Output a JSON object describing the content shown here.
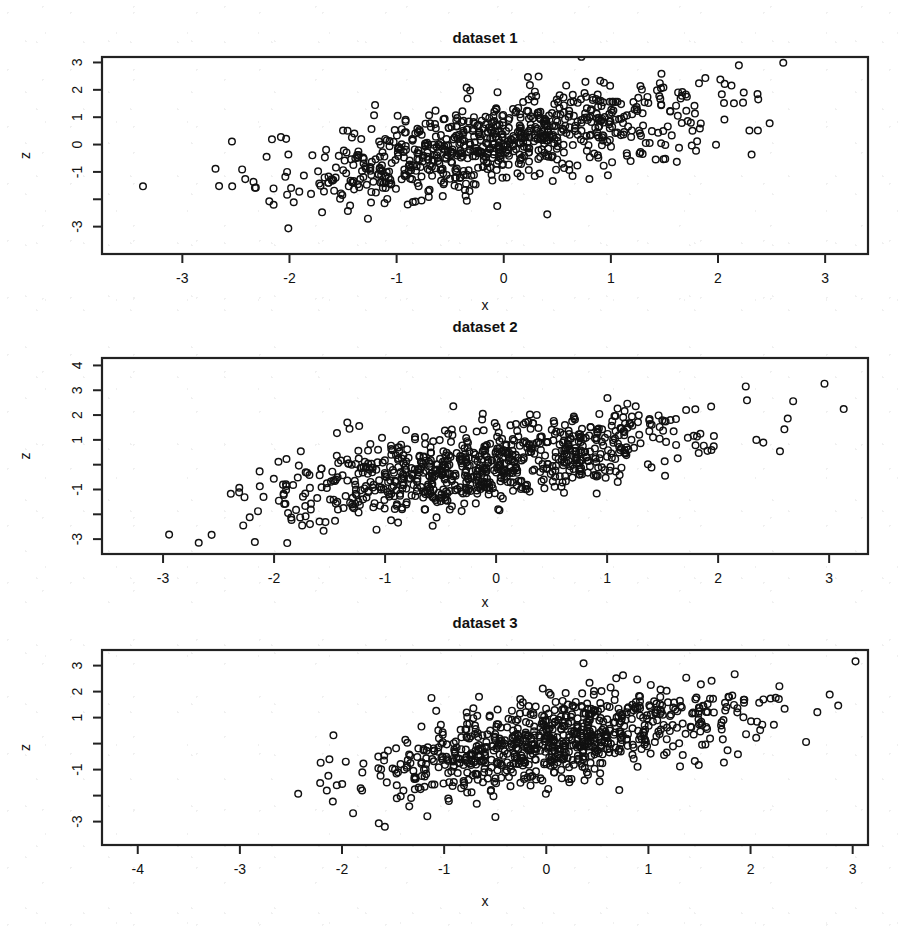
{
  "figure": {
    "width": 912,
    "height": 947,
    "background": "#ffffff",
    "foreground": "#111111",
    "point_color": "#111111",
    "point_symbol": "open-circle"
  },
  "chart_data": [
    {
      "type": "scatter",
      "title": "dataset 1",
      "xlabel": "x",
      "ylabel": "z",
      "xlim": [
        -3.75,
        3.4
      ],
      "ylim": [
        -4.0,
        3.2
      ],
      "xticks": [
        -3,
        -2,
        -1,
        0,
        1,
        2,
        3
      ],
      "xticklabels": [
        "-3",
        "-2",
        "-1",
        "0",
        "1",
        "2",
        "3"
      ],
      "yticks": [
        -3,
        -2,
        -1,
        0,
        1,
        2,
        3
      ],
      "yticklabels": [
        "-3",
        "",
        "-1",
        "0",
        "1",
        "2",
        "3"
      ],
      "grid": false,
      "legend": "none",
      "n": 820,
      "correlation": 0.62,
      "x_mean": -0.1,
      "x_sd": 0.95,
      "z_mean": 0.05,
      "z_sd": 1.0,
      "seed": 11317
    },
    {
      "type": "scatter",
      "title": "dataset 2",
      "xlabel": "x",
      "ylabel": "z",
      "xlim": [
        -3.55,
        3.35
      ],
      "ylim": [
        -3.6,
        4.3
      ],
      "xticks": [
        -3,
        -2,
        -1,
        0,
        1,
        2,
        3
      ],
      "xticklabels": [
        "-3",
        "-2",
        "-1",
        "0",
        "1",
        "2",
        "3"
      ],
      "yticks": [
        -3,
        -2,
        -1,
        0,
        1,
        2,
        3,
        4
      ],
      "yticklabels": [
        "-3",
        "",
        "-1",
        "",
        "1",
        "2",
        "3",
        "4"
      ],
      "grid": false,
      "legend": "none",
      "n": 830,
      "correlation": 0.63,
      "x_mean": -0.08,
      "x_sd": 0.93,
      "z_mean": 0.0,
      "z_sd": 1.05,
      "seed": 24509
    },
    {
      "type": "scatter",
      "title": "dataset 3",
      "xlabel": "x",
      "ylabel": "z",
      "xlim": [
        -4.35,
        3.15
      ],
      "ylim": [
        -3.9,
        3.6
      ],
      "xticks": [
        -4,
        -3,
        -2,
        -1,
        0,
        1,
        2,
        3
      ],
      "xticklabels": [
        "-4",
        "-3",
        "-2",
        "-1",
        "0",
        "1",
        "2",
        "3"
      ],
      "yticks": [
        -3,
        -2,
        -1,
        0,
        1,
        2,
        3
      ],
      "yticklabels": [
        "-3",
        "",
        "-1",
        "",
        "1",
        "2",
        "3"
      ],
      "grid": false,
      "legend": "none",
      "n": 840,
      "correlation": 0.6,
      "x_mean": 0.05,
      "x_sd": 0.92,
      "z_mean": 0.15,
      "z_sd": 0.98,
      "seed": 38821
    }
  ],
  "panels_geometry": [
    {
      "top": 20,
      "height": 300,
      "plot": {
        "x": 102,
        "y": 57,
        "w": 766,
        "h": 197
      },
      "title_y": 43,
      "xlab_y": 310
    },
    {
      "top": 320,
      "height": 300,
      "plot": {
        "x": 102,
        "y": 358,
        "w": 766,
        "h": 196
      },
      "title_y": 332,
      "xlab_y": 607
    },
    {
      "top": 612,
      "height": 335,
      "plot": {
        "x": 102,
        "y": 650,
        "w": 766,
        "h": 195
      },
      "title_y": 628,
      "xlab_y": 906
    }
  ]
}
